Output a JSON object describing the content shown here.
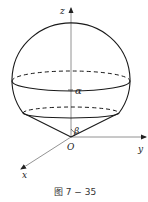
{
  "figure": {
    "caption": "图 7 − 35",
    "axes": {
      "x": "x",
      "y": "y",
      "z": "z",
      "origin": "O"
    },
    "angles": {
      "alpha": "α",
      "beta": "β"
    }
  },
  "colors": {
    "stroke": "#1a1a1a",
    "axis": "#777777",
    "background": "#ffffff"
  }
}
